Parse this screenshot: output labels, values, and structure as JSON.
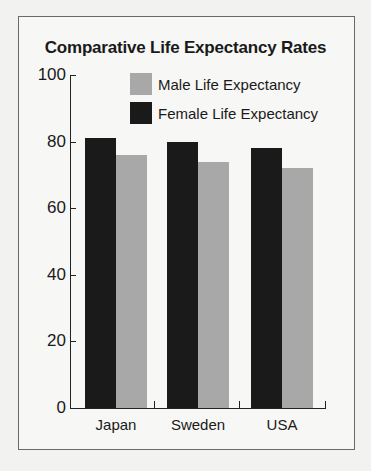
{
  "chart_data": {
    "type": "bar",
    "title": "Comparative Life Expectancy Rates",
    "categories": [
      "Japan",
      "Sweden",
      "USA"
    ],
    "series": [
      {
        "name": "Female Life Expectancy",
        "color": "#1a1a1a",
        "values": [
          81,
          80,
          78
        ]
      },
      {
        "name": "Male Life Expectancy",
        "color": "#a8a8a8",
        "values": [
          76,
          74,
          72
        ]
      }
    ],
    "xlabel": "",
    "ylabel": "",
    "ylim": [
      0,
      100
    ],
    "yticks": [
      "0",
      "20",
      "40",
      "60",
      "80",
      "100"
    ],
    "grid": false,
    "legend_position": "top-inside"
  },
  "legend": [
    {
      "label": "Male Life Expectancy",
      "color": "#a8a8a8"
    },
    {
      "label": "Female Life Expectancy",
      "color": "#1a1a1a"
    }
  ]
}
